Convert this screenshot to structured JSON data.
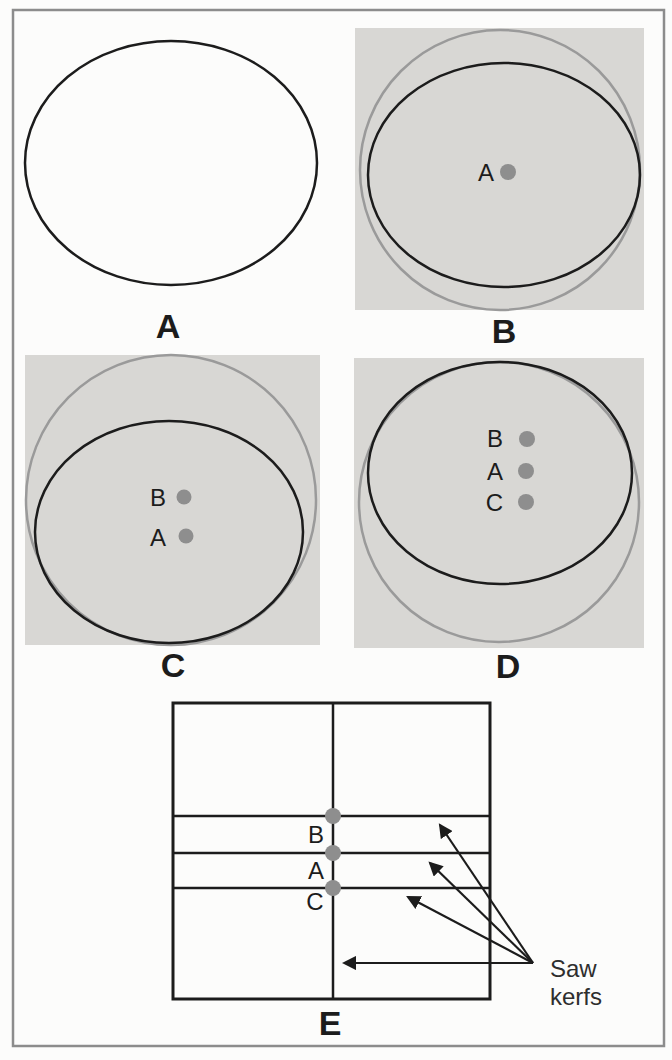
{
  "figure": {
    "panels": [
      {
        "label": "A",
        "points": []
      },
      {
        "label": "B",
        "points": [
          "A"
        ]
      },
      {
        "label": "C",
        "points": [
          "B",
          "A"
        ]
      },
      {
        "label": "D",
        "points": [
          "B",
          "A",
          "C"
        ]
      },
      {
        "label": "E",
        "points": [
          "B",
          "A",
          "C"
        ],
        "annotation_lines": [
          "Saw",
          "kerfs"
        ]
      }
    ],
    "colors": {
      "page_background": "#fcfcfb",
      "panel_background": "#d8d7d4",
      "outline_black": "#1c1c1c",
      "outline_gray": "#9a9a9a",
      "dot_gray": "#8e8e8e",
      "frame_border": "#8c8c8c",
      "annotation_text": "#2e2e2e"
    }
  }
}
